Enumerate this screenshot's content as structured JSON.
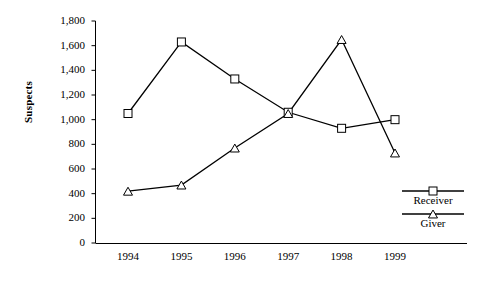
{
  "chart_data": {
    "type": "line",
    "title": "",
    "xlabel": "",
    "ylabel": "Suspects",
    "categories": [
      "1994",
      "1995",
      "1996",
      "1997",
      "1998",
      "1999"
    ],
    "ylim": [
      0,
      1800
    ],
    "ytick_step": 200,
    "yticks": [
      "1,800",
      "1,600",
      "1,400",
      "1,200",
      "1,000",
      "800",
      "600",
      "400",
      "200",
      "0"
    ],
    "ytick_values": [
      1800,
      1600,
      1400,
      1200,
      1000,
      800,
      600,
      400,
      200,
      0
    ],
    "grid": false,
    "legend_position": "right",
    "series": [
      {
        "name": "Receiver",
        "marker": "square",
        "color": "#000000",
        "values": [
          1050,
          1630,
          1330,
          1060,
          930,
          1000
        ]
      },
      {
        "name": "Giver",
        "marker": "triangle",
        "color": "#000000",
        "values": [
          420,
          470,
          770,
          1050,
          1650,
          730
        ]
      }
    ]
  },
  "axis": {
    "y_title": "Suspects"
  },
  "legend": {
    "items": [
      {
        "label": "Receiver",
        "marker": "square-marker-icon"
      },
      {
        "label": "Giver",
        "marker": "triangle-marker-icon"
      }
    ]
  }
}
